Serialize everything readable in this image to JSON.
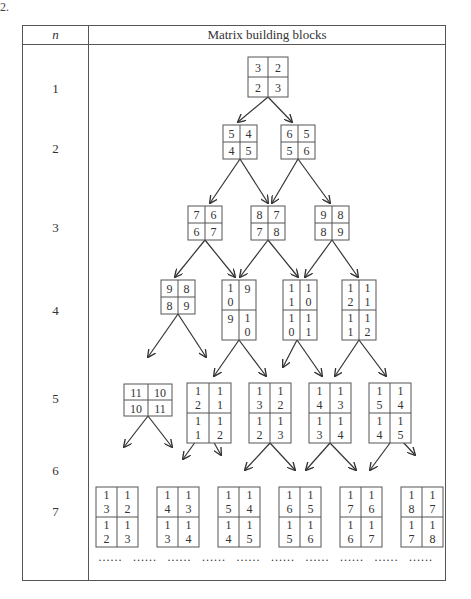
{
  "corner_mark": "2.",
  "table": {
    "col_n_header": "n",
    "col_blocks_header": "Matrix building blocks",
    "n_labels": [
      "1",
      "2",
      "3",
      "4",
      "5",
      "6",
      "7"
    ],
    "ellipsis": "……"
  },
  "blocks": [
    {
      "id": "b1",
      "cells": [
        [
          "3",
          "2"
        ],
        [
          "2",
          "3"
        ]
      ]
    },
    {
      "id": "b2a",
      "cells": [
        [
          "5",
          "4"
        ],
        [
          "4",
          "5"
        ]
      ]
    },
    {
      "id": "b2b",
      "cells": [
        [
          "6",
          "5"
        ],
        [
          "5",
          "6"
        ]
      ]
    },
    {
      "id": "b3a",
      "cells": [
        [
          "7",
          "6"
        ],
        [
          "6",
          "7"
        ]
      ]
    },
    {
      "id": "b3b",
      "cells": [
        [
          "8",
          "7"
        ],
        [
          "7",
          "8"
        ]
      ]
    },
    {
      "id": "b3c",
      "cells": [
        [
          "9",
          "8"
        ],
        [
          "8",
          "9"
        ]
      ]
    },
    {
      "id": "b4a",
      "cells": [
        [
          "9",
          "8"
        ],
        [
          "8",
          "9"
        ]
      ]
    },
    {
      "id": "b4b",
      "cells": [
        [
          "1\n0",
          "9"
        ],
        [
          "9",
          "1\n0"
        ]
      ]
    },
    {
      "id": "b4c",
      "cells": [
        [
          "1\n1",
          "1\n0"
        ],
        [
          "1\n0",
          "1\n1"
        ]
      ]
    },
    {
      "id": "b4d",
      "cells": [
        [
          "1\n2",
          "1\n1"
        ],
        [
          "1\n1",
          "1\n2"
        ]
      ]
    },
    {
      "id": "b5a",
      "cells": [
        [
          "11",
          "10"
        ],
        [
          "10",
          "11"
        ]
      ]
    },
    {
      "id": "b5b",
      "cells": [
        [
          "1\n2",
          "1\n1"
        ],
        [
          "1\n1",
          "1\n2"
        ]
      ]
    },
    {
      "id": "b5c",
      "cells": [
        [
          "1\n3",
          "1\n2"
        ],
        [
          "1\n2",
          "1\n3"
        ]
      ]
    },
    {
      "id": "b5d",
      "cells": [
        [
          "1\n4",
          "1\n3"
        ],
        [
          "1\n3",
          "1\n4"
        ]
      ]
    },
    {
      "id": "b5e",
      "cells": [
        [
          "1\n5",
          "1\n4"
        ],
        [
          "1\n4",
          "1\n5"
        ]
      ]
    },
    {
      "id": "b7a",
      "cells": [
        [
          "1\n3",
          "1\n2"
        ],
        [
          "1\n2",
          "1\n3"
        ]
      ]
    },
    {
      "id": "b7b",
      "cells": [
        [
          "1\n4",
          "1\n3"
        ],
        [
          "1\n3",
          "1\n4"
        ]
      ]
    },
    {
      "id": "b7c",
      "cells": [
        [
          "1\n5",
          "1\n4"
        ],
        [
          "1\n4",
          "1\n5"
        ]
      ]
    },
    {
      "id": "b7d",
      "cells": [
        [
          "1\n6",
          "1\n5"
        ],
        [
          "1\n5",
          "1\n6"
        ]
      ]
    },
    {
      "id": "b7e",
      "cells": [
        [
          "1\n7",
          "1\n6"
        ],
        [
          "1\n6",
          "1\n7"
        ]
      ]
    },
    {
      "id": "b7f",
      "cells": [
        [
          "1\n8",
          "1\n7"
        ],
        [
          "1\n7",
          "1\n8"
        ]
      ]
    }
  ]
}
